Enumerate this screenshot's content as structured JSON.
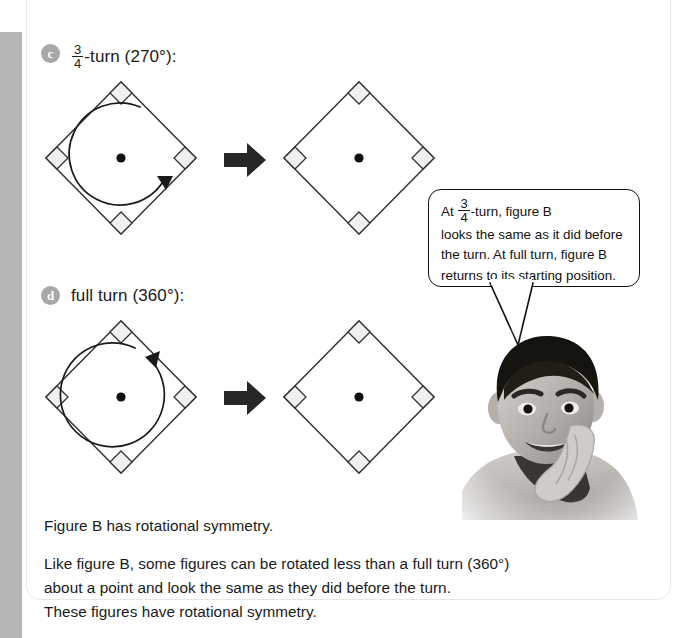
{
  "page": {
    "background_color": "#ffffff",
    "left_bar_color": "#b6b6b6",
    "ink_color": "#1a1a1a"
  },
  "items": [
    {
      "bullet": "c",
      "heading_prefix": "",
      "fraction": {
        "numerator": "3",
        "denominator": "4"
      },
      "heading_suffix": "-turn (270°):",
      "heading_plain": "3/4 -turn (270°):",
      "before_figure": {
        "label": "figure-b-before-three-quarter-turn",
        "shape": "square-rotated-45",
        "center_dot": true,
        "corner_marks": 4,
        "rotation_arc": {
          "direction": "clockwise",
          "sweep_degrees": 270,
          "arrowhead_position": "lower-right"
        }
      },
      "transform_arrow": "right-arrow",
      "after_figure": {
        "label": "figure-b-after-three-quarter-turn",
        "shape": "square-rotated-45",
        "center_dot": true,
        "corner_marks": 4,
        "rotation_arc": null
      }
    },
    {
      "bullet": "d",
      "heading_prefix": "full turn (360°):",
      "fraction": null,
      "heading_suffix": "",
      "heading_plain": "full turn (360°):",
      "before_figure": {
        "label": "figure-b-before-full-turn",
        "shape": "square-rotated-45",
        "center_dot": true,
        "corner_marks": 4,
        "rotation_arc": {
          "direction": "clockwise",
          "sweep_degrees": 350,
          "arrowhead_position": "upper-right"
        }
      },
      "transform_arrow": "right-arrow",
      "after_figure": {
        "label": "figure-b-after-full-turn",
        "shape": "square-rotated-45",
        "center_dot": true,
        "corner_marks": 4,
        "rotation_arc": null
      }
    }
  ],
  "speech_bubble": {
    "line1_prefix": "At",
    "fraction": {
      "numerator": "3",
      "denominator": "4"
    },
    "line1_suffix": "-turn, figure B",
    "line2": "looks the same as it did before",
    "line3": "the turn. At full turn, figure B",
    "line4": "returns to its starting position.",
    "full_text": "At 3/4 -turn, figure B looks the same as it did before the turn. At full turn, figure B returns to its starting position."
  },
  "photo": {
    "alt": "Smiling boy resting his chin on his hand",
    "style": "grayscale-photograph"
  },
  "body": {
    "para1": "Figure B has rotational symmetry.",
    "para2_line1": "Like figure B, some figures can be rotated less than a full turn (360°)",
    "para2_line2": "about a point and look the same as they did before the turn.",
    "para2_line3": "These figures have rotational symmetry."
  }
}
